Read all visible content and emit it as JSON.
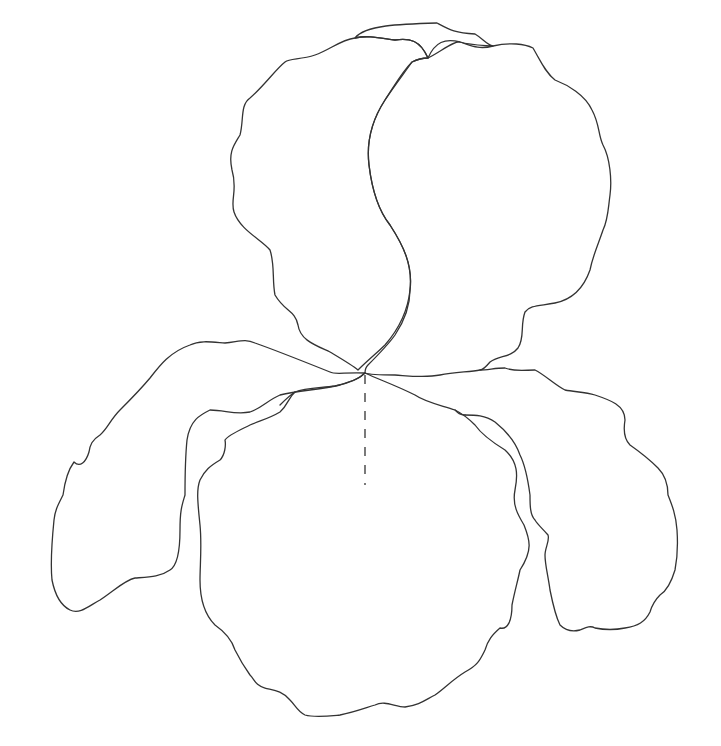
{
  "drawing": {
    "subject": "iris flower outline",
    "stroke_color": "#333333",
    "background": "#ffffff",
    "width": 721,
    "height": 746,
    "parts": [
      {
        "name": "back-standard-petal",
        "d": "M355,38 C365,25 400,24 437,23 C450,30 455,33 475,34 C482,38 487,45 493,46 C478,45 470,45 460,42 C445,38 435,42 428,58 C420,40 410,38 395,40 C380,38 368,35 355,38"
      },
      {
        "name": "left-standard-petal",
        "d": "M355,38 C340,40 330,50 315,55 C300,60 290,58 285,62 C275,70 265,85 250,98 C240,105 244,120 240,135 C234,145 228,152 232,170 C238,190 230,200 234,212 C240,230 262,240 270,250 C275,265 272,280 275,295 C285,312 295,310 298,325 C300,340 315,345 330,352 C340,358 352,365 358,370 C368,360 378,352 385,345 C398,330 408,310 410,290 C413,265 403,245 390,225 C378,210 372,190 369,165 C366,140 372,120 385,100 C395,85 402,72 412,62 C420,58 425,58 428,58 C420,40 410,38 395,40 C380,38 368,35 355,38"
      },
      {
        "name": "right-standard-petal",
        "d": "M428,58 C440,52 455,40 460,42 C470,45 478,50 493,46 C510,42 525,44 533,48 C540,60 545,72 555,80 C568,85 585,95 592,110 C600,125 598,135 603,145 C610,158 612,180 610,195 C608,210 608,220 603,230 C598,245 593,255 590,270 C583,290 570,300 555,303 C540,306 530,305 525,312 C520,325 525,338 518,348 C510,358 500,355 490,362 C485,368 482,370 480,370 C470,372 455,372 440,375 C425,378 410,376 395,375 C385,375 370,375 365,373 C365,370 366,367 368,365 C378,355 388,345 395,335 C405,320 410,305 410,290 C413,265 403,245 390,225 C378,210 372,190 369,165 C366,140 372,120 385,100 C395,85 405,72 412,62 C420,58 425,58 428,58"
      },
      {
        "name": "left-fall-petal",
        "d": "M365,373 C345,372 335,375 330,372 C300,360 275,350 255,343 C245,338 238,342 225,343 C212,342 200,340 190,345 C170,352 160,365 150,378 C140,390 130,400 120,410 C110,420 108,428 100,435 C92,440 90,445 89,452 C86,462 80,468 74,462 C68,470 65,480 63,495 C58,505 55,510 54,520 C52,540 50,560 52,580 C55,595 60,605 70,610 C80,615 90,605 100,600 C115,590 125,580 135,578 C150,577 160,577 170,570 C178,565 180,550 180,530 C180,510 182,505 185,495 C185,480 185,460 187,440 C190,420 200,415 210,410 C225,410 235,415 250,412 C262,408 268,400 280,395 C300,390 320,390 340,385 C355,380 360,378 365,373"
      },
      {
        "name": "front-fall-petal",
        "d": "M365,373 C380,380 395,385 415,395 C425,402 440,405 455,410 C465,415 470,420 475,425 C482,435 492,442 505,450 C518,462 518,475 515,490 C512,505 518,515 524,525 C530,540 533,550 520,570 C518,580 515,590 512,605 C512,620 508,630 500,628 C492,635 488,640 485,650 C480,660 478,665 465,672 C452,680 445,688 435,695 C425,700 420,705 405,707 C395,707 385,700 375,705 C365,708 355,712 340,715 C330,716 315,718 305,715 C298,712 295,705 290,700 C282,690 272,690 265,688 C255,685 255,680 250,675 C245,668 240,660 235,650 C232,640 225,632 215,625 C205,615 200,600 200,580 C200,565 202,545 200,525 C198,505 196,490 200,480 C205,470 210,466 220,460 C225,455 226,445 225,440 C228,435 240,430 250,425 C262,420 270,418 280,412 C288,405 288,398 295,392 C305,388 320,388 335,386 C350,383 360,378 365,373"
      },
      {
        "name": "right-fall-petal",
        "d": "M480,370 C488,370 495,368 505,368 C515,372 525,370 535,370 C545,375 555,385 565,390 C575,392 585,392 595,395 C610,400 625,405 625,420 C623,432 625,440 630,445 C640,452 650,460 658,468 C665,475 668,485 668,495 C672,505 676,515 677,530 C678,545 678,555 675,570 C672,580 668,590 660,595 C655,600 652,605 650,612 C645,622 638,626 625,628 C615,630 605,630 595,628 C590,625 585,628 580,630 C572,632 565,630 560,625 C555,615 552,600 550,590 C548,575 545,565 545,555 C545,548 550,540 548,535 C542,528 538,525 535,520 C530,515 530,505 530,495 C528,480 525,465 520,455 C515,440 505,430 495,422 C485,415 475,415 465,415"
      },
      {
        "name": "fall-inner-curl-left",
        "d": "M295,392 C290,395 285,400 280,405"
      },
      {
        "name": "fall-inner-curl-right",
        "d": "M455,410 C458,413 460,415 465,415"
      }
    ],
    "style_line": {
      "name": "center-stem-dashed-line",
      "x": 365,
      "y1": 375,
      "y2": 485
    }
  }
}
